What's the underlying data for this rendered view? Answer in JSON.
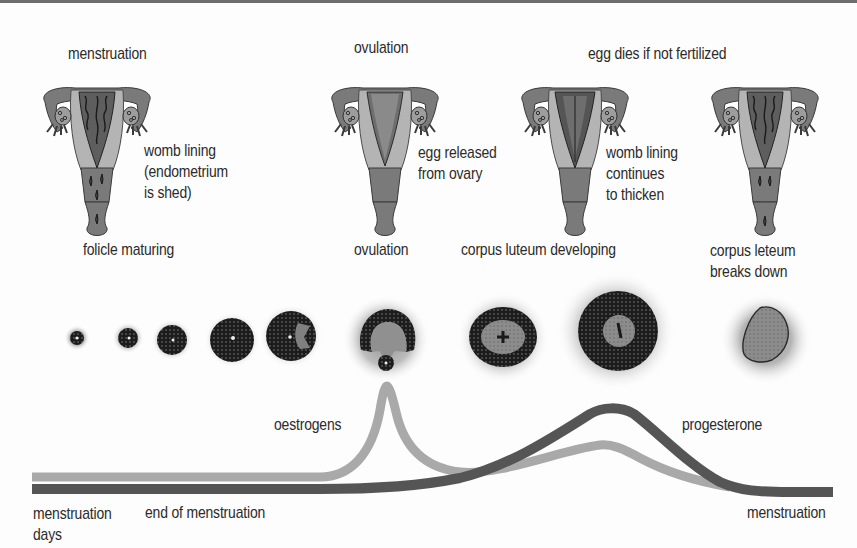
{
  "diagram": {
    "stages_top": [
      {
        "label": "menstruation",
        "note": "womb lining\n(endometrium\nis shed)"
      },
      {
        "label": "ovulation",
        "note": "egg released\nfrom ovary"
      },
      {
        "label": "egg dies if not fertilized",
        "note": "womb lining\ncontinues\nto thicken"
      },
      {
        "label": "",
        "note": ""
      }
    ],
    "follicle_labels": [
      {
        "label": "folicle maturing"
      },
      {
        "label": "ovulation"
      },
      {
        "label": "corpus luteum developing"
      },
      {
        "label": "corpus leteum\nbreaks down"
      }
    ],
    "hormones": [
      {
        "name": "oestrogens",
        "color": "#a9a9a9"
      },
      {
        "name": "progesterone",
        "color": "#555555"
      }
    ],
    "timeline": {
      "start_label": "menstruation\ndays",
      "mid_label": "end of menstruation",
      "end_label": "menstruation"
    },
    "colors": {
      "border": "#6e6e6e",
      "text": "#2b2b2b",
      "uterus_outer": "#7a7a7a",
      "uterus_wall": "#b4b4b4",
      "lining": "#5e5e5e",
      "oestrogen_curve": "#a9a9a9",
      "progesterone_curve": "#555555"
    }
  }
}
